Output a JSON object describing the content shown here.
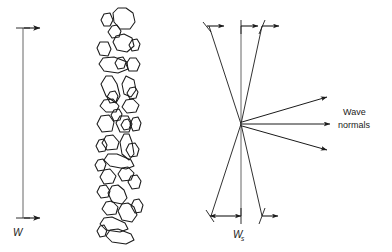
{
  "figure": {
    "type": "schematic-diagram",
    "background_color": "#ffffff",
    "stroke_color": "#1a1a1a",
    "text_color": "#1a1a1a"
  },
  "labels": {
    "beam_width": "W",
    "spot_width": "W",
    "spot_width_subscript": "s",
    "wave_normals_line1": "Wave",
    "wave_normals_line2": "normals"
  },
  "panels": {
    "left": {
      "name": "incident-beam-width",
      "dimension_label": "W",
      "dimension_line": {
        "x": 23,
        "y_top": 28,
        "y_bottom": 218
      },
      "arrow_direction": "right"
    },
    "middle": {
      "name": "grain-structure-column",
      "description": "column of irregular polygonal grain outlines",
      "grain_count": 38,
      "column_x_range": [
        96,
        142
      ],
      "column_y_range": [
        8,
        244
      ]
    },
    "right": {
      "name": "converging-diverging-beam",
      "dimension_label": "Ws",
      "apex": {
        "x": 241,
        "y": 124
      },
      "dimension_line": {
        "x": 241,
        "y_top": 26,
        "y_bottom": 216
      },
      "top_tick_xs": [
        210,
        241,
        262
      ],
      "bottom_tick_xs": [
        212,
        241,
        262
      ],
      "wave_normal_arrows": 3
    }
  }
}
